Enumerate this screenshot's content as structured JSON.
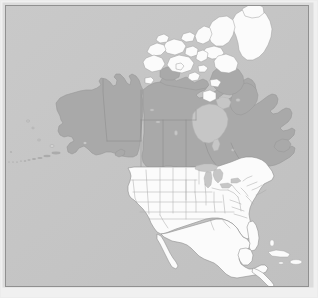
{
  "figure": {
    "kind": "map-image",
    "title": "North America reference map",
    "width": 318,
    "height": 298
  },
  "map": {
    "projection_hint": "lambert-conformal-conic",
    "background_label": "ocean",
    "frame_label": "map border frame",
    "colors": {
      "page_background": "#f0f0f0",
      "ocean": "#c6c6c6",
      "ocean_shade": "#c1c1c1",
      "highlight_fill": "#a9a9a9",
      "plain_fill": "#fbfbfb",
      "inland_water": "#c9c9c9",
      "coast_stroke": "#9a9a9a",
      "internal_border_stroke": "#a5a5a5",
      "state_border_stroke": "#b0b0b0",
      "frame_outer": "#d9d9d9",
      "frame_line": "#8f8f8f"
    },
    "regions": [
      {
        "id": "canada",
        "name": "Canada",
        "style": "highlight",
        "has_internal_borders": true
      },
      {
        "id": "alaska",
        "name": "Alaska",
        "style": "highlight",
        "has_internal_borders": false
      },
      {
        "id": "aleutians",
        "name": "Aleutian Islands",
        "style": "highlight",
        "has_internal_borders": false
      },
      {
        "id": "united-states",
        "name": "United States (contiguous)",
        "style": "plain",
        "has_internal_borders": true
      },
      {
        "id": "mexico",
        "name": "Mexico",
        "style": "plain",
        "has_internal_borders": false
      },
      {
        "id": "central-america",
        "name": "Central America",
        "style": "plain",
        "has_internal_borders": false
      },
      {
        "id": "arctic-archipelago",
        "name": "Canadian Arctic Archipelago",
        "style": "plain",
        "has_internal_borders": false
      },
      {
        "id": "greenland",
        "name": "Greenland",
        "style": "plain",
        "has_internal_borders": false
      },
      {
        "id": "hudson-bay",
        "name": "Hudson Bay",
        "style": "inland-water",
        "has_internal_borders": false
      },
      {
        "id": "great-lakes",
        "name": "Great Lakes",
        "style": "inland-water",
        "has_internal_borders": false
      },
      {
        "id": "caribbean-islands",
        "name": "Caribbean Islands",
        "style": "plain",
        "has_internal_borders": false
      }
    ],
    "legend_visible": false,
    "labels_visible": false,
    "graticule_visible": false
  }
}
